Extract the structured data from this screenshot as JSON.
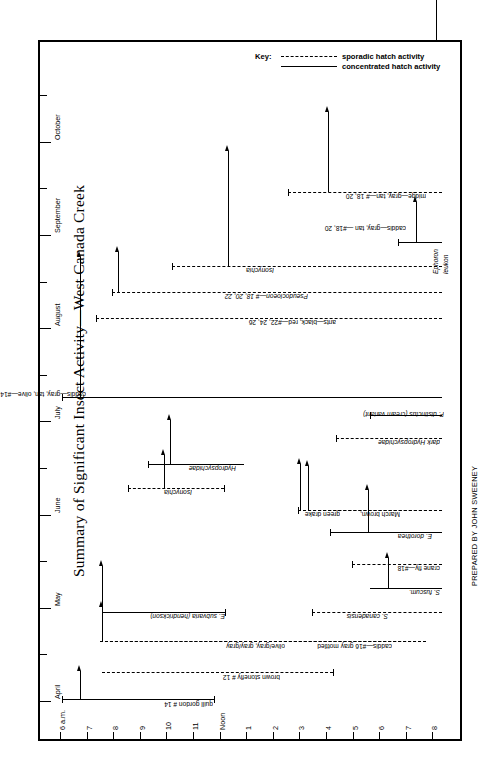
{
  "title": "Summary of Significant Insect Activity—West Canada Creek",
  "credit": "PREPARED BY JOHN SWEENEY",
  "key": {
    "label": "Key:",
    "sporadic": "sporadic hatch activity",
    "concentrated": "concentrated hatch activity"
  },
  "axes": {
    "month_axis_label": "",
    "months": [
      "April",
      "May",
      "June",
      "July",
      "August",
      "September",
      "October"
    ],
    "hour_axis_label": "",
    "hours": [
      "6 a.m.",
      "7",
      "8",
      "9",
      "10",
      "11",
      "Noon",
      "1",
      "2",
      "3",
      "4",
      "5",
      "6",
      "7",
      "8"
    ]
  },
  "chart_data": {
    "type": "table",
    "title": "Summary of Significant Insect Activity—West Canada Creek",
    "xlabel": "Time of day",
    "ylabel": "Month",
    "x": [
      "6 a.m.",
      "7",
      "8",
      "9",
      "10",
      "11",
      "Noon",
      "1",
      "2",
      "3",
      "4",
      "5",
      "6",
      "7",
      "8"
    ],
    "categories": [
      "April",
      "May",
      "June",
      "July",
      "August",
      "September",
      "October"
    ],
    "legend": [
      "sporadic hatch activity",
      "concentrated hatch activity"
    ],
    "legend_position": "top-center",
    "grid": false,
    "series": [
      {
        "name": "quill gordon # 14",
        "month": "April",
        "start_hour": "11",
        "end_hour": "3",
        "peak_hour": "Noon",
        "activity": "concentrated"
      },
      {
        "name": "brown stonefly # 12",
        "month": "April-May",
        "start_hour": "11",
        "end_hour": "4",
        "peak_hour": "11:30",
        "activity": "sporadic"
      },
      {
        "name": "caddis—#16 gray mottled",
        "month": "May",
        "start_hour": "11",
        "end_hour": "8",
        "peak_hour": "Noon",
        "activity": "sporadic"
      },
      {
        "name": "olive/gray, gray/gray",
        "month": "May",
        "start_hour": "11",
        "end_hour": "8",
        "peak_hour": "Noon",
        "activity": "sporadic"
      },
      {
        "name": "E. subvaria (hendrickson)",
        "month": "May",
        "start_hour": "Noon",
        "end_hour": "3",
        "peak_hour": "1",
        "activity": "concentrated"
      },
      {
        "name": "S. canadensis",
        "month": "May",
        "start_hour": "5",
        "end_hour": "8",
        "peak_hour": "7",
        "activity": "sporadic"
      },
      {
        "name": "S. fuscum.",
        "month": "May-June",
        "start_hour": "7",
        "end_hour": "8",
        "peak_hour": "7:30",
        "activity": "concentrated"
      },
      {
        "name": "crane fly—#18",
        "month": "May-June",
        "start_hour": "6",
        "end_hour": "8",
        "peak_hour": "7:30",
        "activity": "sporadic"
      },
      {
        "name": "E. dorothea",
        "month": "June",
        "start_hour": "5",
        "end_hour": "8",
        "peak_hour": "6",
        "activity": "sporadic"
      },
      {
        "name": "March brown,",
        "month": "June",
        "start_hour": "4",
        "end_hour": "8",
        "peak_hour": "4:30",
        "activity": "concentrated"
      },
      {
        "name": "green drake",
        "month": "June",
        "start_hour": "4",
        "end_hour": "8",
        "peak_hour": "4",
        "activity": "concentrated"
      },
      {
        "name": "Isonychia",
        "month": "June",
        "start_hour": "2",
        "end_hour": "4",
        "peak_hour": "3",
        "activity": "sporadic"
      },
      {
        "name": "Hydropsychidae",
        "month": "June-July",
        "start_hour": "2",
        "end_hour": "4",
        "peak_hour": "3",
        "activity": "concentrated"
      },
      {
        "name": "dark Hydropsychidae",
        "month": "July",
        "start_hour": "6",
        "end_hour": "8",
        "peak_hour": "6:30",
        "activity": "sporadic"
      },
      {
        "name": "P. distinctus (cream variant)",
        "month": "July",
        "start_hour": "7",
        "end_hour": "8",
        "peak_hour": "8",
        "activity": "concentrated"
      },
      {
        "name": "caddis—gray, tan, olive—#14, 16, 18, 20",
        "month": "July-Aug",
        "start_hour": "11",
        "end_hour": "8",
        "peak_hour": "Noon",
        "activity": "concentrated"
      },
      {
        "name": "ants—black, red—#22, 24, 26",
        "month": "August",
        "start_hour": "Noon",
        "end_hour": "8",
        "peak_hour": "Noon",
        "activity": "sporadic"
      },
      {
        "name": "Pseudocloeon—# 18, 20, 22",
        "month": "August",
        "start_hour": "1",
        "end_hour": "8",
        "peak_hour": "1",
        "activity": "sporadic"
      },
      {
        "name": "Isonychia",
        "month": "August",
        "start_hour": "2",
        "end_hour": "8",
        "peak_hour": "3",
        "activity": "sporadic"
      },
      {
        "name": "caddis—gray, tan —#18, 20",
        "month": "Sept",
        "start_hour": "6",
        "end_hour": "8",
        "peak_hour": "7",
        "activity": "concentrated"
      },
      {
        "name": "Ephoron leukon",
        "month": "Sept",
        "start_hour": "8",
        "end_hour": "8",
        "peak_hour": "8",
        "activity": "concentrated"
      },
      {
        "name": "midge—gray, tan—# 18, 20",
        "month": "Sept-Oct",
        "start_hour": "4",
        "end_hour": "8",
        "peak_hour": "5",
        "activity": "sporadic"
      }
    ]
  },
  "hatches": [
    {
      "label": "quill gordon # 14",
      "ital": false,
      "style": "solid",
      "x": 22,
      "y": 657,
      "w": 152,
      "cap_left": true,
      "cap_right": true,
      "arrow_x": 40,
      "arrow_h": 28,
      "label_x": 173,
      "label_y": 666
    },
    {
      "label": "brown stonefly # 12",
      "ital": false,
      "style": "dashed",
      "x": 62,
      "y": 630,
      "w": 231,
      "cap_left": false,
      "cap_right": true,
      "arrow_x": 60,
      "arrow_h": 0,
      "label_x": 240,
      "label_y": 639
    },
    {
      "label": "olive/gray, gray/gray",
      "ital": false,
      "style": "dashed",
      "x": 60,
      "y": 599,
      "w": 326,
      "cap_left": false,
      "cap_right": false,
      "arrow_x": 62,
      "arrow_h": 34,
      "label_x": 245,
      "label_y": 608
    },
    {
      "label": "caddis—#16 gray mottled",
      "ital": false,
      "style": "dashed",
      "x": 60,
      "y": 599,
      "w": 326,
      "cap_left": false,
      "cap_right": false,
      "arrow_x": -1,
      "arrow_h": 0,
      "label_x": 352,
      "label_y": 608
    },
    {
      "label": "E. subvaria (hendrickson)",
      "ital": true,
      "style": "solid",
      "x": 62,
      "y": 570,
      "w": 123,
      "cap_left": false,
      "cap_right": true,
      "arrow_x": 62,
      "arrow_h": 46,
      "label_x": 185,
      "label_y": 578
    },
    {
      "label": "S. canadensis",
      "ital": true,
      "style": "dashed",
      "x": 272,
      "y": 570,
      "w": 130,
      "cap_left": true,
      "cap_right": false,
      "arrow_x": -1,
      "arrow_h": 0,
      "label_x": 348,
      "label_y": 578
    },
    {
      "label": "S. fuscum.",
      "ital": true,
      "style": "solid",
      "x": 330,
      "y": 546,
      "w": 72,
      "cap_left": false,
      "cap_right": false,
      "arrow_x": 348,
      "arrow_h": 30,
      "label_x": 400,
      "label_y": 554
    },
    {
      "label": "crane fly—#18",
      "ital": false,
      "style": "dashed",
      "x": 312,
      "y": 522,
      "w": 90,
      "cap_left": true,
      "cap_right": false,
      "arrow_x": -1,
      "arrow_h": 0,
      "label_x": 400,
      "label_y": 530
    },
    {
      "label": "E. dorothea",
      "ital": true,
      "style": "solid",
      "x": 290,
      "y": 490,
      "w": 112,
      "cap_left": true,
      "cap_right": false,
      "arrow_x": 328,
      "arrow_h": 42,
      "label_x": 392,
      "label_y": 498
    },
    {
      "label": "March brown,",
      "ital": false,
      "style": "dashed",
      "x": 258,
      "y": 468,
      "w": 144,
      "cap_left": true,
      "cap_right": false,
      "arrow_x": 260,
      "arrow_h": 46,
      "label_x": 360,
      "label_y": 476
    },
    {
      "label": "green drake",
      "ital": false,
      "style": "dashed",
      "x": 258,
      "y": 468,
      "w": 144,
      "cap_left": false,
      "cap_right": false,
      "arrow_x": 268,
      "arrow_h": 44,
      "label_x": 300,
      "label_y": 476
    },
    {
      "label": "Isonychia",
      "ital": true,
      "style": "dashed",
      "x": 88,
      "y": 446,
      "w": 96,
      "cap_left": true,
      "cap_right": true,
      "arrow_x": 124,
      "arrow_h": 33,
      "label_x": 152,
      "label_y": 454
    },
    {
      "label": "Hydropsychidae",
      "ital": true,
      "style": "solid",
      "x": 108,
      "y": 422,
      "w": 96,
      "cap_left": true,
      "cap_right": false,
      "arrow_x": 130,
      "arrow_h": 44,
      "label_x": 196,
      "label_y": 430
    },
    {
      "label": "dark Hydropsychidae",
      "ital": true,
      "style": "dashed",
      "x": 296,
      "y": 396,
      "w": 106,
      "cap_left": true,
      "cap_right": false,
      "arrow_x": -1,
      "arrow_h": 0,
      "label_x": 400,
      "label_y": 404
    },
    {
      "label": "P. distinctus (cream variant)",
      "ital": true,
      "style": "solid",
      "x": 330,
      "y": 373,
      "w": 72,
      "cap_left": true,
      "cap_right": false,
      "arrow_x": -1,
      "arrow_h": 0,
      "label_x": 404,
      "label_y": 376
    },
    {
      "label": "caddis—gray, tan, olive—#14, 16, 18, 20",
      "ital": false,
      "style": "solid",
      "x": 22,
      "y": 355,
      "w": 380,
      "cap_left": true,
      "cap_right": false,
      "arrow_x": 40,
      "arrow_h": 140,
      "label_x": 46,
      "label_y": 356
    },
    {
      "label": "ants—black, red—#22, 24, 26",
      "ital": false,
      "style": "dashed",
      "x": 56,
      "y": 276,
      "w": 346,
      "cap_left": true,
      "cap_right": false,
      "arrow_x": -1,
      "arrow_h": 0,
      "label_x": 296,
      "label_y": 284
    },
    {
      "label": "Pseudocloeon—# 18, 20, 22",
      "ital": true,
      "style": "dashed",
      "x": 72,
      "y": 250,
      "w": 330,
      "cap_left": true,
      "cap_right": false,
      "arrow_x": 78,
      "arrow_h": 40,
      "label_x": 268,
      "label_y": 258
    },
    {
      "label": "Isonychia",
      "ital": true,
      "style": "dashed",
      "x": 132,
      "y": 224,
      "w": 270,
      "cap_left": true,
      "cap_right": false,
      "arrow_x": 188,
      "arrow_h": 115,
      "label_x": 234,
      "label_y": 232
    },
    {
      "label": "caddis—gray, tan —#18, 20",
      "ital": false,
      "style": "solid",
      "x": 358,
      "y": 200,
      "w": 44,
      "cap_left": true,
      "cap_right": false,
      "arrow_x": 376,
      "arrow_h": 40,
      "label_x": 366,
      "label_y": 190
    },
    {
      "label": "Ephoron",
      "ital": true,
      "style": "none",
      "x": 0,
      "y": 0,
      "w": 0,
      "cap_left": false,
      "cap_right": false,
      "arrow_x": 396,
      "arrow_h": 64,
      "label_x": 392,
      "label_y": 232
    },
    {
      "label": "leukon",
      "ital": true,
      "style": "none",
      "x": 0,
      "y": 0,
      "w": 0,
      "cap_left": false,
      "cap_right": false,
      "arrow_x": -1,
      "arrow_h": 0,
      "label_x": 402,
      "label_y": 232
    },
    {
      "label": "midge—gray, tan—# 18, 20",
      "ital": false,
      "style": "dashed",
      "x": 248,
      "y": 150,
      "w": 154,
      "cap_left": true,
      "cap_right": false,
      "arrow_x": 288,
      "arrow_h": 80,
      "label_x": 386,
      "label_y": 158
    }
  ]
}
